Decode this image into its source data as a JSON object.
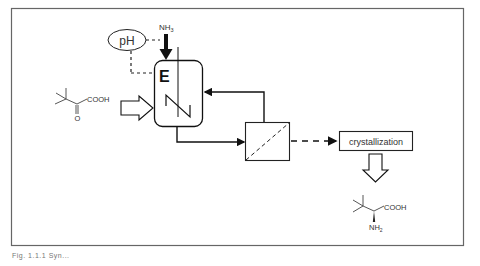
{
  "figure": {
    "caption": "Fig. 1.1.1 Syn..."
  },
  "nodes": {
    "ph_sensor": {
      "label": "pH"
    },
    "ammonia_feed": {
      "label": "NH",
      "subscript": "3"
    },
    "enzyme_reactor": {
      "label": "E"
    },
    "filter": {
      "label": ""
    },
    "crystallization": {
      "label": "crystallization"
    },
    "substrate": {
      "label": "COOH",
      "oxo": "O"
    },
    "product": {
      "label": "COOH",
      "amine": "NH",
      "amine_subscript": "2"
    }
  },
  "edges": [
    {
      "from": "substrate",
      "to": "enzyme_reactor",
      "style": "hollow-arrow"
    },
    {
      "from": "ammonia_feed",
      "to": "enzyme_reactor",
      "style": "thick-arrow"
    },
    {
      "from": "ph_sensor",
      "to": "enzyme_reactor",
      "style": "dashed-control"
    },
    {
      "from": "ph_sensor",
      "to": "ammonia_feed",
      "style": "dashed-control"
    },
    {
      "from": "enzyme_reactor",
      "to": "filter",
      "style": "solid-arrow"
    },
    {
      "from": "filter",
      "to": "enzyme_reactor",
      "style": "solid-arrow-recycle"
    },
    {
      "from": "filter",
      "to": "crystallization",
      "style": "dashed-arrow"
    },
    {
      "from": "crystallization",
      "to": "product",
      "style": "hollow-arrow"
    }
  ],
  "colors": {
    "line": "#111111",
    "frame": "#666666",
    "background": "#ffffff"
  }
}
